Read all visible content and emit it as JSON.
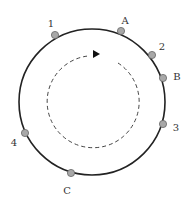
{
  "diagram": {
    "circle": {
      "cx": 92,
      "cy": 102,
      "r": 73,
      "stroke": "#222222"
    },
    "inner_arc": {
      "cx": 92,
      "cy": 102,
      "r": 46,
      "stroke": "#444444",
      "direction": "clockwise"
    },
    "points": [
      {
        "label": "1",
        "x": 55,
        "y": 35,
        "lx": 51,
        "ly": 24
      },
      {
        "label": "A",
        "x": 121,
        "y": 31,
        "lx": 125,
        "ly": 21
      },
      {
        "label": "2",
        "x": 152,
        "y": 55,
        "lx": 162,
        "ly": 47
      },
      {
        "label": "B",
        "x": 163,
        "y": 78,
        "lx": 177,
        "ly": 77
      },
      {
        "label": "3",
        "x": 163,
        "y": 124,
        "lx": 176,
        "ly": 128
      },
      {
        "label": "4",
        "x": 25,
        "y": 133,
        "lx": 14,
        "ly": 143
      },
      {
        "label": "C",
        "x": 71,
        "y": 173,
        "lx": 67,
        "ly": 191
      }
    ],
    "point_fill": "#a8a8a8"
  }
}
